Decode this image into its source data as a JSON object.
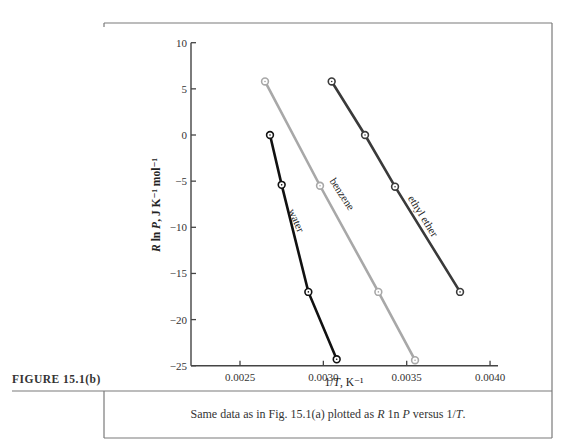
{
  "figure": {
    "label": "FIGURE 15.1(b)",
    "caption_parts": [
      "Same data as in Fig. 15.1(a) plotted as ",
      "R",
      " 1n ",
      "P",
      " versus 1/",
      "T",
      "."
    ]
  },
  "chart_data": {
    "type": "line",
    "title": "",
    "xlabel": "1/T, K⁻¹",
    "ylabel": "R ln P, J K⁻¹ mol⁻¹",
    "xlim": [
      0.0022,
      0.004
    ],
    "ylim": [
      -25,
      10
    ],
    "x_ticks": [
      0.0025,
      0.003,
      0.0035,
      0.004
    ],
    "x_tick_labels": [
      "0.0025",
      "0.0030",
      "0.0035",
      "0.0040"
    ],
    "y_ticks": [
      10,
      5,
      0,
      -5,
      -10,
      -15,
      -20,
      -25
    ],
    "y_tick_labels": [
      "10",
      "5",
      "0",
      "-5",
      "-10",
      "-15",
      "-20",
      "-25"
    ],
    "grid": false,
    "legend": "none (series labeled inline along lines)",
    "series": [
      {
        "name": "water",
        "color": "#111111",
        "x": [
          0.00268,
          0.00275,
          0.00291,
          0.00308
        ],
        "y": [
          0.0,
          -5.4,
          -17.0,
          -24.3
        ]
      },
      {
        "name": "benzene",
        "color": "#a8a8a8",
        "x": [
          0.00265,
          0.00298,
          0.00333,
          0.00355
        ],
        "y": [
          5.8,
          -5.5,
          -17.0,
          -24.4
        ]
      },
      {
        "name": "ethyl ether",
        "color": "#3a3a3a",
        "x": [
          0.00305,
          0.00325,
          0.00343,
          0.00382
        ],
        "y": [
          5.8,
          0.0,
          -5.6,
          -17.0
        ]
      }
    ]
  }
}
